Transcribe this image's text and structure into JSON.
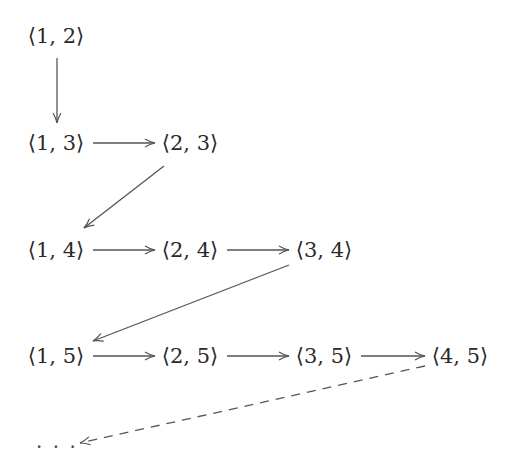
{
  "diagram": {
    "nodes": [
      {
        "id": "n12",
        "label": "⟨1, 2⟩"
      },
      {
        "id": "n13",
        "label": "⟨1, 3⟩"
      },
      {
        "id": "n23",
        "label": "⟨2, 3⟩"
      },
      {
        "id": "n14",
        "label": "⟨1, 4⟩"
      },
      {
        "id": "n24",
        "label": "⟨2, 4⟩"
      },
      {
        "id": "n34",
        "label": "⟨3, 4⟩"
      },
      {
        "id": "n15",
        "label": "⟨1, 5⟩"
      },
      {
        "id": "n25",
        "label": "⟨2, 5⟩"
      },
      {
        "id": "n35",
        "label": "⟨3, 5⟩"
      },
      {
        "id": "n45",
        "label": "⟨4, 5⟩"
      }
    ],
    "continuation": {
      "label": "· · ·"
    },
    "edges": [
      {
        "from": "n12",
        "to": "n13",
        "style": "solid"
      },
      {
        "from": "n13",
        "to": "n23",
        "style": "solid"
      },
      {
        "from": "n23",
        "to": "n14",
        "style": "solid"
      },
      {
        "from": "n14",
        "to": "n24",
        "style": "solid"
      },
      {
        "from": "n24",
        "to": "n34",
        "style": "solid"
      },
      {
        "from": "n34",
        "to": "n15",
        "style": "solid"
      },
      {
        "from": "n15",
        "to": "n25",
        "style": "solid"
      },
      {
        "from": "n25",
        "to": "n35",
        "style": "solid"
      },
      {
        "from": "n35",
        "to": "n45",
        "style": "solid"
      },
      {
        "from": "n45",
        "to": "continuation",
        "style": "dashed"
      }
    ],
    "colors": {
      "stroke": "#555555",
      "text": "#2a2a2a"
    }
  }
}
